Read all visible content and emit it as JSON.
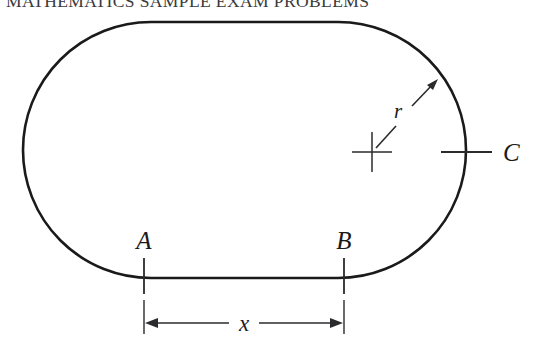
{
  "header": {
    "text": "MATHEMATICS SAMPLE EXAM PROBLEMS"
  },
  "figure": {
    "name": "stadium-with-radius-and-chord",
    "labels": {
      "point_a": "A",
      "point_b": "B",
      "point_c": "C",
      "radius": "r",
      "dimension_x": "x"
    },
    "colors": {
      "outline": "#1a1a1a",
      "annotation": "#2b2b2e",
      "background": "#ffffff",
      "header_text": "#3a3a3c"
    },
    "geometry": {
      "left_edge_x": 23,
      "right_edge_x": 466,
      "top_edge_y": 22,
      "bottom_edge_y": 278,
      "center_y": 150,
      "radius_px": 128,
      "center_cross_x": 372,
      "center_cross_y": 152,
      "radius_arrow_tip_x": 438,
      "radius_arrow_tip_y": 80,
      "tick_a_x": 144,
      "tick_b_x": 344,
      "tick_c_y": 152,
      "dimension_line_y": 323
    }
  }
}
